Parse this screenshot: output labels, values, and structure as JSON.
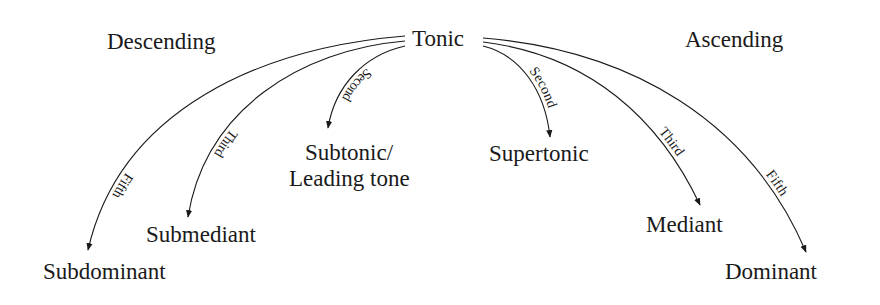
{
  "diagram": {
    "root": {
      "label": "Tonic"
    },
    "directions": {
      "descending": "Descending",
      "ascending": "Ascending"
    },
    "descending": [
      {
        "interval": "Second",
        "target": "Subtonic/",
        "target_line2": "Leading tone"
      },
      {
        "interval": "Third",
        "target": "Submediant"
      },
      {
        "interval": "Fifth",
        "target": "Subdominant"
      }
    ],
    "ascending": [
      {
        "interval": "Second",
        "target": "Supertonic"
      },
      {
        "interval": "Third",
        "target": "Mediant"
      },
      {
        "interval": "Fifth",
        "target": "Dominant"
      }
    ],
    "colors": {
      "ink": "#1a1a1a",
      "background": "#ffffff"
    }
  }
}
